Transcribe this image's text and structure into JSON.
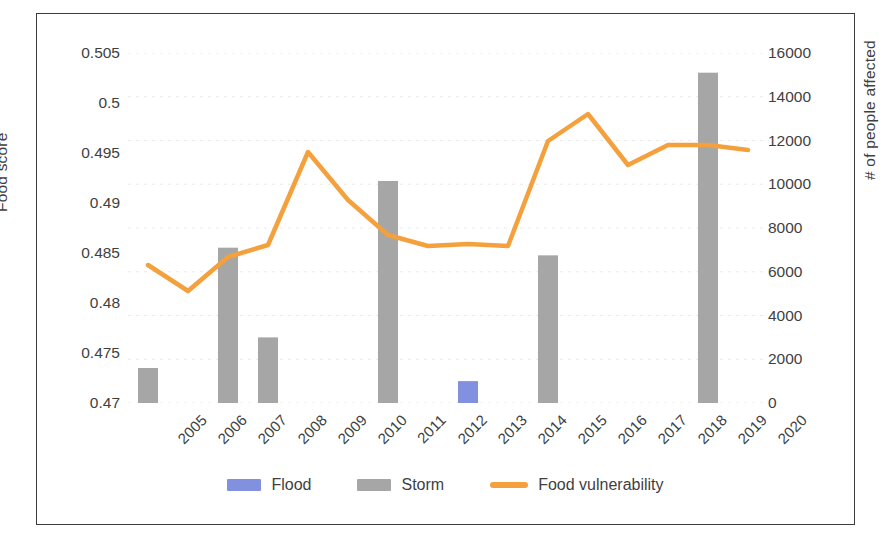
{
  "chart_data": {
    "type": "bar",
    "title": "",
    "categories": [
      "2005",
      "2006",
      "2007",
      "2008",
      "2009",
      "2010",
      "2011",
      "2012",
      "2013",
      "2014",
      "2015",
      "2016",
      "2017",
      "2018",
      "2019",
      "2020"
    ],
    "series": [
      {
        "name": "Flood",
        "type": "bar",
        "axis": "right",
        "color": "#8290e0",
        "values": [
          0,
          0,
          0,
          0,
          0,
          0,
          0,
          0,
          1000,
          0,
          0,
          0,
          0,
          0,
          0,
          0
        ]
      },
      {
        "name": "Storm",
        "type": "bar",
        "axis": "right",
        "color": "#a6a6a6",
        "values": [
          1600,
          0,
          7100,
          3000,
          0,
          0,
          10150,
          0,
          0,
          0,
          6750,
          0,
          0,
          0,
          15100,
          0
        ]
      },
      {
        "name": "Food vulnerability",
        "type": "line",
        "axis": "left",
        "color": "#f4a03c",
        "values": [
          0.4838,
          0.4812,
          0.4846,
          0.4858,
          0.4951,
          0.4903,
          0.4868,
          0.4857,
          0.4859,
          0.4857,
          0.4962,
          0.4989,
          0.4938,
          0.4958,
          0.4958,
          0.4953
        ]
      }
    ],
    "xlabel": "",
    "ylabel": "Food score",
    "y2label": "# of people affected",
    "ylim": [
      0.47,
      0.505
    ],
    "y2lim": [
      0,
      16000
    ],
    "yticks": [
      "0.47",
      "0.475",
      "0.48",
      "0.485",
      "0.49",
      "0.495",
      "0.5",
      "0.505"
    ],
    "y2ticks": [
      "0",
      "2000",
      "4000",
      "6000",
      "8000",
      "10000",
      "12000",
      "14000",
      "16000"
    ],
    "grid": "horizontal-faint",
    "legend_position": "bottom-center"
  },
  "axes": {
    "left_title": "Food score",
    "right_title": "# of people affected"
  },
  "legend": {
    "items": [
      {
        "label": "Flood",
        "marker": "bar-swatch",
        "color": "#8290e0"
      },
      {
        "label": "Storm",
        "marker": "bar-swatch",
        "color": "#a6a6a6"
      },
      {
        "label": "Food vulnerability",
        "marker": "line-swatch",
        "color": "#f4a03c"
      }
    ]
  }
}
